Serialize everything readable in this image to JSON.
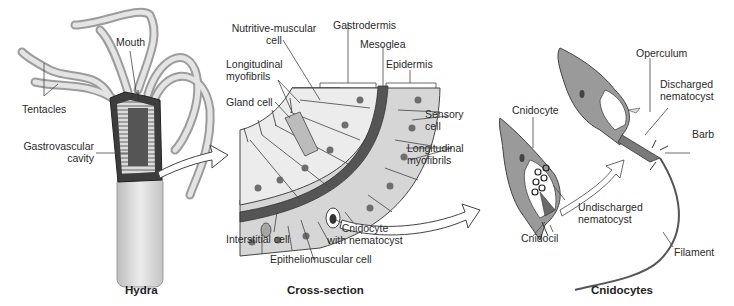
{
  "panels": {
    "hydra": {
      "caption": "Hydra",
      "labels": {
        "mouth": "Mouth",
        "tentacles": "Tentacles",
        "gastrovascular_1": "Gastrovascular",
        "gastrovascular_2": "cavity"
      }
    },
    "cross_section": {
      "caption": "Cross-section",
      "labels": {
        "nutritive_1": "Nutritive-muscular",
        "nutritive_2": "cell",
        "gastrodermis": "Gastrodermis",
        "mesoglea": "Mesoglea",
        "epidermis": "Epidermis",
        "long_myo_left_1": "Longitudinal",
        "long_myo_left_2": "myofibrils",
        "gland_cell": "Gland cell",
        "sensory_1": "Sensory",
        "sensory_2": "cell",
        "long_myo_right_1": "Longitudinal",
        "long_myo_right_2": "myofibrils",
        "interstitial": "Interstitial cell",
        "cnidocyte_nem_1": "Cnidocyte",
        "cnidocyte_nem_2": "with nematocyst",
        "epitheliomuscular": "Epitheliomuscular cell"
      }
    },
    "cnidocytes": {
      "caption": "Cnidocytes",
      "labels": {
        "operculum": "Operculum",
        "discharged_1": "Discharged",
        "discharged_2": "nematocyst",
        "barb": "Barb",
        "cnidocyte": "Cnidocyte",
        "undischarged_1": "Undischarged",
        "undischarged_2": "nematocyst",
        "cnidocil": "Cnidocil",
        "filament": "Filament"
      }
    }
  },
  "colors": {
    "body_fill": "#d9d9d9",
    "body_dark": "#8a8a8a",
    "mesoglea": "#555555",
    "cell_fill": "#e6e6e6",
    "nucleus": "#6e6e6e",
    "cnidocyte_fill": "#9a9a9a",
    "line": "#333333"
  }
}
